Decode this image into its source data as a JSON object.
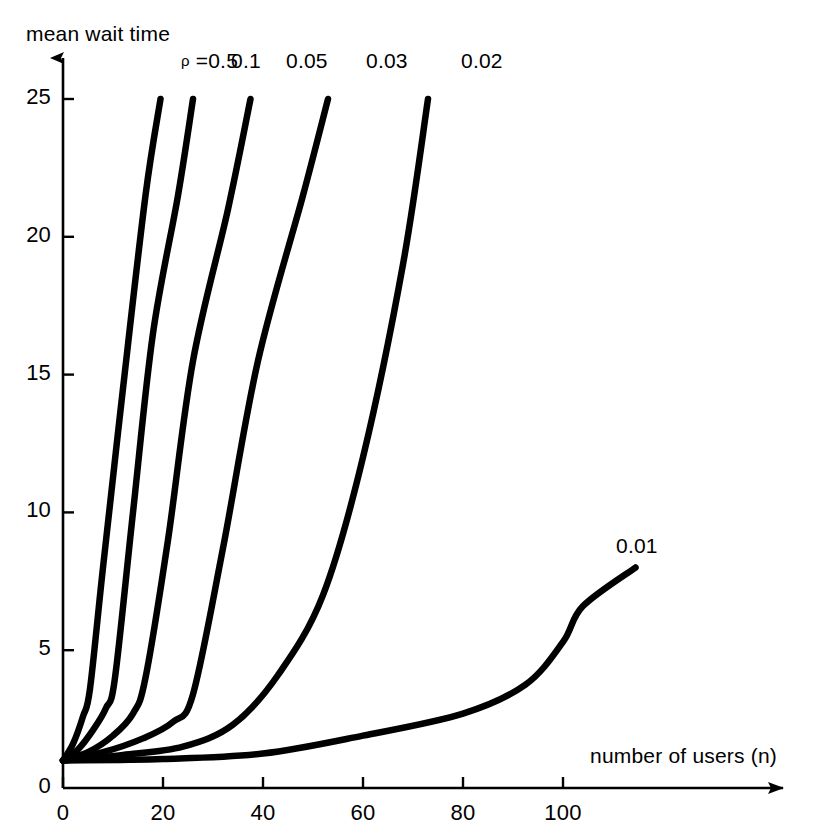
{
  "chart_data": {
    "type": "line",
    "title": "",
    "ylabel": "mean wait time",
    "xlabel": "number of users (n)",
    "xlim": [
      0,
      112
    ],
    "ylim": [
      0,
      26.5
    ],
    "xticks": [
      0,
      20,
      40,
      60,
      80,
      100
    ],
    "xtick_labels": [
      "0",
      "20",
      "40",
      "60",
      "80",
      "100"
    ],
    "yticks": [
      0,
      5,
      10,
      15,
      20,
      25
    ],
    "ytick_labels": [
      "0",
      "5",
      "10",
      "15",
      "20",
      "25"
    ],
    "grid": false,
    "legend_position": "inline-at-curve-ends",
    "legend_prefix_symbol": "ρ",
    "legend_prefix_text": "=",
    "annotations": [
      {
        "text": "ρ =0.5",
        "x": 30,
        "y": 26.3
      },
      {
        "text": "0.1",
        "x": 40,
        "y": 26.3
      },
      {
        "text": "0.05",
        "x": 51,
        "y": 26.3
      },
      {
        "text": "0.03",
        "x": 67,
        "y": 26.3
      },
      {
        "text": "0.02",
        "x": 86,
        "y": 26.3
      },
      {
        "text": "0.01",
        "x": 117,
        "y": 8.7
      }
    ],
    "series": [
      {
        "name": "0.5",
        "label": "ρ =0.5",
        "color": "#000000",
        "points": [
          [
            0,
            1.0
          ],
          [
            2,
            1.6
          ],
          [
            4,
            2.6
          ],
          [
            5.4,
            3.6
          ],
          [
            8,
            8.0
          ],
          [
            12,
            14.5
          ],
          [
            16.5,
            21.5
          ],
          [
            19.5,
            25.0
          ]
        ]
      },
      {
        "name": "0.1",
        "label": "0.1",
        "color": "#000000",
        "points": [
          [
            0,
            1.0
          ],
          [
            3,
            1.4
          ],
          [
            6,
            2.1
          ],
          [
            8.6,
            2.9
          ],
          [
            10.4,
            4.0
          ],
          [
            14,
            10.0
          ],
          [
            18,
            16.5
          ],
          [
            23,
            21.5
          ],
          [
            26,
            25.0
          ]
        ]
      },
      {
        "name": "0.05",
        "label": "0.05",
        "color": "#000000",
        "points": [
          [
            0,
            1.0
          ],
          [
            5,
            1.3
          ],
          [
            10,
            1.9
          ],
          [
            14,
            2.7
          ],
          [
            16.5,
            4.0
          ],
          [
            21,
            9.0
          ],
          [
            26,
            15.5
          ],
          [
            33,
            21.0
          ],
          [
            37.5,
            25.0
          ]
        ]
      },
      {
        "name": "0.03",
        "label": "0.03",
        "color": "#000000",
        "points": [
          [
            0,
            1.0
          ],
          [
            8,
            1.3
          ],
          [
            16,
            1.8
          ],
          [
            22,
            2.4
          ],
          [
            26,
            3.4
          ],
          [
            32,
            8.7
          ],
          [
            39,
            15.5
          ],
          [
            48,
            21.5
          ],
          [
            53,
            25.0
          ]
        ]
      },
      {
        "name": "0.02",
        "label": "0.02",
        "color": "#000000",
        "points": [
          [
            0,
            1.0
          ],
          [
            12,
            1.2
          ],
          [
            24,
            1.5
          ],
          [
            34,
            2.3
          ],
          [
            43,
            4.1
          ],
          [
            52,
            7.0
          ],
          [
            60,
            12.0
          ],
          [
            68,
            19.0
          ],
          [
            73,
            25.0
          ]
        ]
      },
      {
        "name": "0.01",
        "label": "0.01",
        "color": "#000000",
        "points": [
          [
            0,
            1.0
          ],
          [
            20,
            1.05
          ],
          [
            40,
            1.25
          ],
          [
            60,
            1.9
          ],
          [
            80,
            2.7
          ],
          [
            92.5,
            3.75
          ],
          [
            100,
            5.3
          ],
          [
            104,
            6.6
          ],
          [
            114.5,
            8.0
          ]
        ]
      }
    ]
  },
  "axes": {
    "y_axis_arrow": "arrow-up",
    "x_axis_arrow": "arrow-right"
  }
}
